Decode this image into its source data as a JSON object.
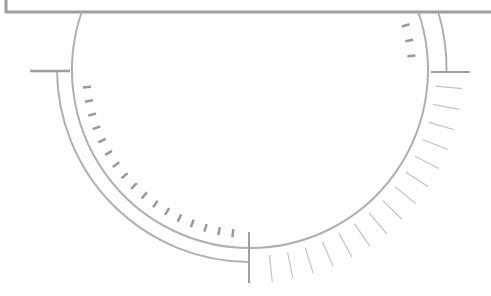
{
  "diagram": {
    "colors": {
      "frame": "#9e9e9e",
      "arc": "#b0b0b0",
      "tick_dark": "#999999",
      "tick_light": "#c4c4c4",
      "background": "#ffffff"
    },
    "center": [
      250,
      70
    ],
    "inner_radius": 178,
    "outer_left_radius": 193,
    "outer_right_radius": 197,
    "inner_left_ticks": {
      "count": 17,
      "start_deg": 174,
      "end_deg": 96,
      "r1": 160,
      "r2": 168
    },
    "inner_right_ticks": {
      "count": 3,
      "start_deg": -16,
      "end_deg": -5,
      "r1": 158,
      "r2": 166
    },
    "outer_ticks": {
      "count": 15,
      "start_deg": 5,
      "end_deg": 84,
      "r1": 186,
      "r2": 213
    }
  }
}
